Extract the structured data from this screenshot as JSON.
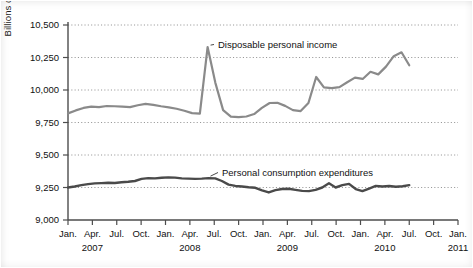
{
  "figure": {
    "background_color": "#ffffff",
    "axis_color": "#4d4d4d",
    "grid_color": "#8c8c8c",
    "text_color": "#111111"
  },
  "chart_data": {
    "type": "line",
    "title": "",
    "xlabel": "",
    "ylabel": "Billions of 2005 Dollars",
    "ylim": [
      9000,
      10500
    ],
    "ytick_values": [
      9000,
      9250,
      9500,
      9750,
      10000,
      10250,
      10500
    ],
    "ytick_labels": [
      "9,000",
      "9,250",
      "9,500",
      "9,750",
      "10,000",
      "10,250",
      "10,500"
    ],
    "grid": true,
    "grid_axis": "y",
    "grid_style": "dotted",
    "legend": "annotations",
    "xtick_labels": [
      "Jan.",
      "Apr.",
      "Jul.",
      "Oct.",
      "Jan.",
      "Apr.",
      "Jul.",
      "Oct.",
      "Jan.",
      "Apr.",
      "Jul.",
      "Oct.",
      "Jan.",
      "Apr.",
      "Jul.",
      "Oct.",
      "Jan."
    ],
    "xyear_labels": [
      {
        "label": "2007",
        "tick_index": 1
      },
      {
        "label": "2008",
        "tick_index": 5
      },
      {
        "label": "2009",
        "tick_index": 9
      },
      {
        "label": "2010",
        "tick_index": 13
      },
      {
        "label": "2011",
        "tick_index": 16
      }
    ],
    "x_months": [
      "2007-01",
      "2007-02",
      "2007-03",
      "2007-04",
      "2007-05",
      "2007-06",
      "2007-07",
      "2007-08",
      "2007-09",
      "2007-10",
      "2007-11",
      "2007-12",
      "2008-01",
      "2008-02",
      "2008-03",
      "2008-04",
      "2008-05",
      "2008-06",
      "2008-07",
      "2008-08",
      "2008-09",
      "2008-10",
      "2008-11",
      "2008-12",
      "2009-01",
      "2009-02",
      "2009-03",
      "2009-04",
      "2009-05",
      "2009-06",
      "2009-07",
      "2009-08",
      "2009-09",
      "2009-10",
      "2009-11",
      "2009-12",
      "2010-01",
      "2010-02",
      "2010-03",
      "2010-04",
      "2010-05",
      "2010-06",
      "2010-07"
    ],
    "series": [
      {
        "name": "Disposable personal income",
        "color": "#8a8a8a",
        "width": 2.2,
        "annotation": "Disposable personal income",
        "values": [
          9820,
          9843,
          9862,
          9872,
          9868,
          9877,
          9875,
          9872,
          9868,
          9883,
          9893,
          9886,
          9875,
          9866,
          9856,
          9840,
          9822,
          9818,
          10330,
          10055,
          9845,
          9795,
          9792,
          9796,
          9815,
          9862,
          9900,
          9902,
          9878,
          9845,
          9838,
          9900,
          10100,
          10020,
          10015,
          10022,
          10060,
          10095,
          10085,
          10140,
          10120,
          10180,
          10260,
          10290,
          10190
        ]
      },
      {
        "name": "Personal consumption expenditures",
        "color": "#4a4a4a",
        "width": 2.4,
        "annotation": "Personal consumption expenditures",
        "values": [
          9250,
          9258,
          9268,
          9276,
          9282,
          9284,
          9286,
          9285,
          9290,
          9294,
          9300,
          9316,
          9322,
          9320,
          9325,
          9328,
          9326,
          9320,
          9318,
          9316,
          9318,
          9322,
          9320,
          9300,
          9272,
          9262,
          9258,
          9252,
          9248,
          9228,
          9212,
          9230,
          9238,
          9240,
          9232,
          9224,
          9222,
          9232,
          9250,
          9282,
          9250,
          9268,
          9278,
          9238,
          9222,
          9242,
          9262,
          9258,
          9262,
          9256,
          9260,
          9268
        ]
      }
    ],
    "annotations": [
      {
        "text": "Disposable personal income",
        "series": "Disposable personal income",
        "leader": true
      },
      {
        "text": "Personal consumption expenditures",
        "series": "Personal consumption expenditures",
        "leader": true
      }
    ]
  }
}
